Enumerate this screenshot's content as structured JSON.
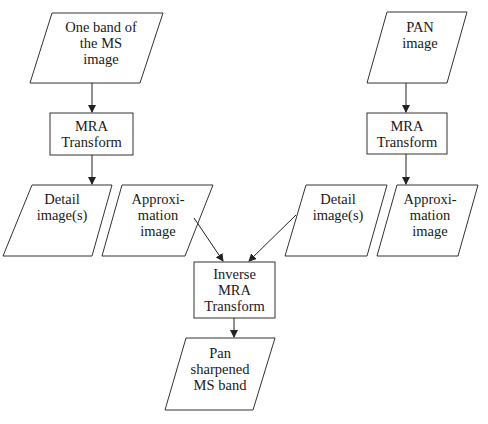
{
  "diagram": {
    "nodes": {
      "ms_band": {
        "line1": "One band of",
        "line2": "the MS",
        "line3": "image"
      },
      "mra_left": {
        "line1": "MRA",
        "line2": "Transform"
      },
      "pan_image": {
        "line1": "PAN",
        "line2": "image"
      },
      "mra_right": {
        "line1": "MRA",
        "line2": "Transform"
      },
      "detail_left": {
        "line1": "Detail",
        "line2": "image(s)"
      },
      "approx_left": {
        "line1": "Approxi-",
        "line2": "mation",
        "line3": "image"
      },
      "detail_right": {
        "line1": "Detail",
        "line2": "image(s)"
      },
      "approx_right": {
        "line1": "Approxi-",
        "line2": "mation",
        "line3": "image"
      },
      "inverse_mra": {
        "line1": "Inverse",
        "line2": "MRA",
        "line3": "Transform"
      },
      "pan_sharpened": {
        "line1": "Pan",
        "line2": "sharpened",
        "line3": "MS band"
      }
    },
    "edges": [
      {
        "from": "ms_band",
        "to": "mra_left"
      },
      {
        "from": "mra_left",
        "to": "detail_left"
      },
      {
        "from": "pan_image",
        "to": "mra_right"
      },
      {
        "from": "mra_right",
        "to": "approx_right"
      },
      {
        "from": "approx_left",
        "to": "inverse_mra"
      },
      {
        "from": "detail_right",
        "to": "inverse_mra"
      },
      {
        "from": "inverse_mra",
        "to": "pan_sharpened"
      }
    ]
  }
}
